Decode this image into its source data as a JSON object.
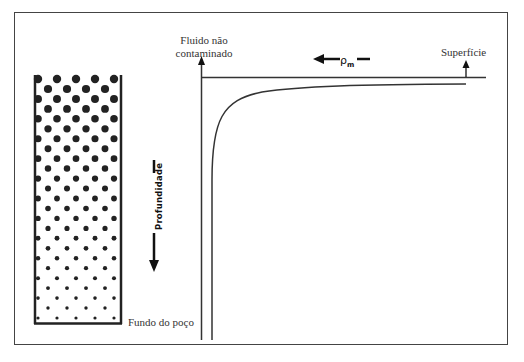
{
  "diagram": {
    "labels": {
      "uncontaminated_fluid_line1": "Fluido não",
      "uncontaminated_fluid_line2": "contaminado",
      "surface": "Superfície",
      "well_bottom": "Fundo do poço",
      "depth_axis": "Profundidade",
      "density_symbol": "ρ",
      "density_subscript": "m"
    },
    "well_column": {
      "pattern": "dots decreasing in size with depth",
      "rows": 25,
      "dot_radius_top": 4.2,
      "dot_radius_bottom": 1.6
    },
    "curve": {
      "description": "Densidade decresce rapidamente perto do fundo e se aproxima assintoticamente do valor do fluido não contaminado em direção à superfície"
    },
    "colors": {
      "line": "#333333",
      "dots": "#222222",
      "frame": "#444444",
      "background": "#ffffff"
    }
  }
}
